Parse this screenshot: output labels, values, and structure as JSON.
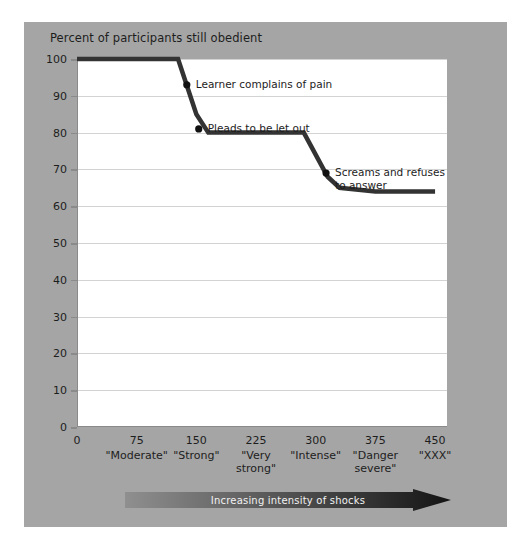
{
  "figure": {
    "background_color": "#a5a5a5",
    "plot_background_color": "#ffffff",
    "line_color": "#333333",
    "gridline_color": "#d3d3d3",
    "axis_color": "#8a8a8a",
    "arrow_label": "Increasing intensity of shocks",
    "arrow_color_start": "#8f8f8f",
    "arrow_color_end": "#1a1a1a"
  },
  "chart_data": {
    "type": "line",
    "title": "Percent of participants still obedient",
    "xlabel": "",
    "ylabel": "Percent of participants still obedient",
    "xlim": [
      0,
      465
    ],
    "ylim": [
      0,
      100
    ],
    "grid": true,
    "legend": "none",
    "y_ticks": [
      0,
      10,
      20,
      30,
      40,
      50,
      60,
      70,
      80,
      90,
      100
    ],
    "x_ticks": [
      0,
      75,
      150,
      225,
      300,
      375,
      450
    ],
    "x_tick_words": [
      "",
      "\"Moderate\"",
      "\"Strong\"",
      "\"Very\nstrong\"",
      "\"Intense\"",
      "\"Danger\nsevere\"",
      "\"XXX\""
    ],
    "x": [
      0,
      127,
      150,
      165,
      285,
      315,
      330,
      375,
      450
    ],
    "values": [
      100,
      100,
      85,
      80,
      80,
      68,
      65,
      64,
      64
    ],
    "series": [
      {
        "name": "Percent still obedient",
        "x": [
          0,
          127,
          150,
          165,
          285,
          315,
          330,
          375,
          450
        ],
        "values": [
          100,
          100,
          85,
          80,
          80,
          68,
          65,
          64,
          64
        ]
      }
    ],
    "annotations": [
      {
        "text": "Learner complains of pain",
        "point_x": 138,
        "point_y": 93
      },
      {
        "text": "Pleads to be let out",
        "point_x": 153,
        "point_y": 81
      },
      {
        "text": "Screams and refuses\nto answer",
        "point_x": 313,
        "point_y": 69
      }
    ]
  }
}
